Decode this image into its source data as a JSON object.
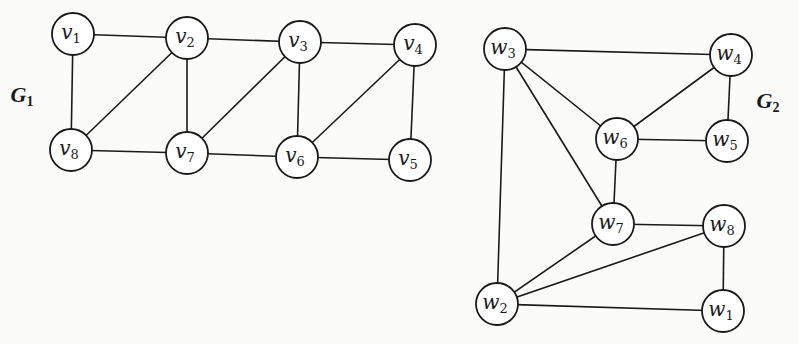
{
  "diagram": {
    "type": "graph-pair",
    "colors": {
      "background": "#fbfbfa",
      "stroke": "#1a1a1a",
      "node_fill": "#ffffff"
    },
    "graphs": [
      {
        "id": "G1",
        "label": {
          "base": "G",
          "sub": "1",
          "x": 22,
          "y": 102
        },
        "node_radius": 21,
        "nodes": [
          {
            "id": "v1",
            "base": "v",
            "sub": "1",
            "x": 73,
            "y": 34
          },
          {
            "id": "v2",
            "base": "v",
            "sub": "2",
            "x": 187,
            "y": 38
          },
          {
            "id": "v3",
            "base": "v",
            "sub": "3",
            "x": 300,
            "y": 42
          },
          {
            "id": "v4",
            "base": "v",
            "sub": "4",
            "x": 415,
            "y": 45
          },
          {
            "id": "v5",
            "base": "v",
            "sub": "5",
            "x": 410,
            "y": 160
          },
          {
            "id": "v6",
            "base": "v",
            "sub": "6",
            "x": 297,
            "y": 157
          },
          {
            "id": "v7",
            "base": "v",
            "sub": "7",
            "x": 187,
            "y": 153
          },
          {
            "id": "v8",
            "base": "v",
            "sub": "8",
            "x": 71,
            "y": 150
          }
        ],
        "edges": [
          [
            "v1",
            "v2"
          ],
          [
            "v2",
            "v3"
          ],
          [
            "v3",
            "v4"
          ],
          [
            "v1",
            "v8"
          ],
          [
            "v8",
            "v2"
          ],
          [
            "v2",
            "v7"
          ],
          [
            "v7",
            "v3"
          ],
          [
            "v3",
            "v6"
          ],
          [
            "v6",
            "v4"
          ],
          [
            "v4",
            "v5"
          ],
          [
            "v8",
            "v7"
          ],
          [
            "v7",
            "v6"
          ],
          [
            "v6",
            "v5"
          ]
        ]
      },
      {
        "id": "G2",
        "label": {
          "base": "G",
          "sub": "2",
          "x": 768,
          "y": 108
        },
        "node_radius": 21,
        "nodes": [
          {
            "id": "w1",
            "base": "w",
            "sub": "1",
            "x": 723,
            "y": 311
          },
          {
            "id": "w2",
            "base": "w",
            "sub": "2",
            "x": 497,
            "y": 304
          },
          {
            "id": "w3",
            "base": "w",
            "sub": "3",
            "x": 505,
            "y": 49
          },
          {
            "id": "w4",
            "base": "w",
            "sub": "4",
            "x": 731,
            "y": 55
          },
          {
            "id": "w5",
            "base": "w",
            "sub": "5",
            "x": 727,
            "y": 141
          },
          {
            "id": "w6",
            "base": "w",
            "sub": "6",
            "x": 617,
            "y": 139
          },
          {
            "id": "w7",
            "base": "w",
            "sub": "7",
            "x": 613,
            "y": 224
          },
          {
            "id": "w8",
            "base": "w",
            "sub": "8",
            "x": 724,
            "y": 226
          }
        ],
        "edges": [
          [
            "w3",
            "w4"
          ],
          [
            "w3",
            "w6"
          ],
          [
            "w3",
            "w7"
          ],
          [
            "w3",
            "w2"
          ],
          [
            "w4",
            "w6"
          ],
          [
            "w4",
            "w5"
          ],
          [
            "w6",
            "w5"
          ],
          [
            "w6",
            "w7"
          ],
          [
            "w7",
            "w8"
          ],
          [
            "w7",
            "w2"
          ],
          [
            "w8",
            "w2"
          ],
          [
            "w8",
            "w1"
          ],
          [
            "w2",
            "w1"
          ]
        ]
      }
    ]
  }
}
